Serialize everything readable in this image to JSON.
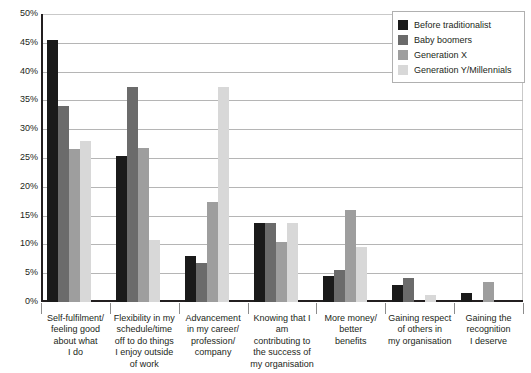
{
  "chart_data": {
    "type": "bar",
    "title": "",
    "subtitle": "",
    "xlabel": "",
    "ylabel": "",
    "ylim": [
      0,
      50
    ],
    "ytick_labels": [
      "50%",
      "45%",
      "40%",
      "35%",
      "30%",
      "25%",
      "20%",
      "15%",
      "10%",
      "5%",
      "0%"
    ],
    "ytick_values": [
      50,
      45,
      40,
      35,
      30,
      25,
      20,
      15,
      10,
      5,
      0
    ],
    "grid": true,
    "legend_position": "top-right",
    "value_unit": "%",
    "categories": [
      "Self-fulfilment/ feeling good about what I do",
      "Flexibility in my schedule/time off to do things I enjoy outside of work",
      "Advancement in my career/ profession/ company",
      "Knowing that I am contributing to the success of my organisation",
      "More money/ better benefits",
      "Gaining respect of others in my organisation",
      "Gaining the recognition I deserve"
    ],
    "category_lines": [
      [
        "Self-fulfilment/",
        "feeling good",
        "about what",
        "I do"
      ],
      [
        "Flexibility in my",
        "schedule/time",
        "off to do things",
        "I enjoy outside",
        "of work"
      ],
      [
        "Advancement",
        "in my career/",
        "profession/",
        "company"
      ],
      [
        "Knowing that I am",
        "contributing to",
        "the success of",
        "my organisation"
      ],
      [
        "More money/",
        "better",
        "benefits"
      ],
      [
        "Gaining respect",
        "of others in",
        "my organisation"
      ],
      [
        "Gaining the",
        "recognition",
        "I deserve"
      ]
    ],
    "series": [
      {
        "name": "Before traditionalist",
        "color": "#1a1a1a",
        "values": [
          45.5,
          25.3,
          8.0,
          13.8,
          4.5,
          3.0,
          1.6
        ]
      },
      {
        "name": "Baby boomers",
        "color": "#6b6b6b",
        "values": [
          34.0,
          37.3,
          6.7,
          13.7,
          5.5,
          4.2,
          0.0
        ]
      },
      {
        "name": "Generation X",
        "color": "#9e9e9e",
        "values": [
          26.5,
          26.7,
          17.3,
          10.5,
          15.9,
          0.0,
          3.4
        ]
      },
      {
        "name": "Generation Y/Millennials",
        "color": "#d8d8d8",
        "values": [
          28.0,
          10.7,
          37.3,
          13.8,
          9.5,
          1.3,
          0.0
        ]
      }
    ]
  },
  "legend": {
    "items": [
      {
        "label": "Before traditionalist",
        "color": "#1a1a1a"
      },
      {
        "label": "Baby boomers",
        "color": "#6b6b6b"
      },
      {
        "label": "Generation X",
        "color": "#9e9e9e"
      },
      {
        "label": "Generation Y/Millennials",
        "color": "#d8d8d8"
      }
    ]
  }
}
